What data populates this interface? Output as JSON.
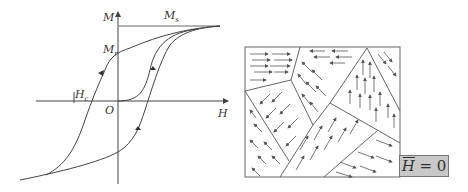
{
  "hysteresis": {
    "axis_y_label": "M",
    "axis_x_label": "H",
    "origin_label": "O",
    "saturation_label": "M",
    "saturation_sub": "s",
    "remanence_label": "M",
    "remanence_sub": "r",
    "coercivity_label": "H",
    "coercivity_sub": "c"
  },
  "domains": {
    "field_label_symbol": "H",
    "field_label_value": " = 0",
    "colors": {
      "line": "#555555",
      "box_fill": "#c8c8c8"
    }
  }
}
